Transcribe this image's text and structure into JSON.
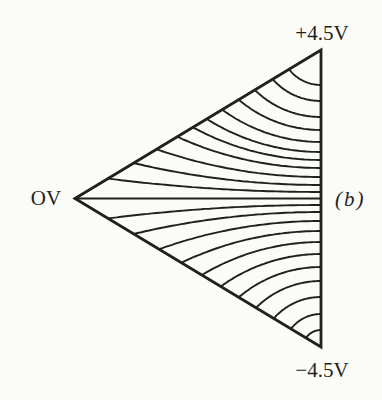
{
  "figure": {
    "caption": "(b)",
    "labels": {
      "top_voltage": "+4.5V",
      "left_voltage": "OV",
      "bottom_voltage": "−4.5V"
    },
    "colors": {
      "ink": "#221f1c",
      "paper": "#fbfbf8"
    },
    "geometry": {
      "canvas_width": 382,
      "canvas_height": 400,
      "triangle": {
        "left_vertex": [
          75,
          198.5
        ],
        "top_right_vertex": [
          321,
          50
        ],
        "bottom_right_vertex": [
          321,
          347
        ]
      },
      "upper_edge_intercepts_y": [
        85,
        101,
        117,
        130,
        142,
        152,
        160,
        168,
        177,
        185,
        192
      ],
      "lower_edge_intercepts_y": [
        205,
        212,
        221,
        231,
        242,
        254,
        267,
        281,
        297,
        314,
        330
      ],
      "outline_stroke_width": 2.8,
      "midline_stroke_width": 2.1,
      "contour_stroke_width": 1.9
    }
  }
}
